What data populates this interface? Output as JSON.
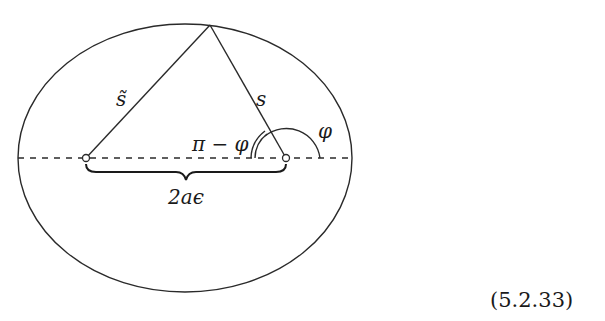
{
  "figure": {
    "stroke_color": "#2a2a2a",
    "labels": {
      "left_distance": "s̃",
      "right_distance": "s",
      "angle_phi": "φ",
      "angle_supplement": "π − φ",
      "focal_distance": "2aϵ"
    },
    "equation_number": "(5.2.33)"
  }
}
